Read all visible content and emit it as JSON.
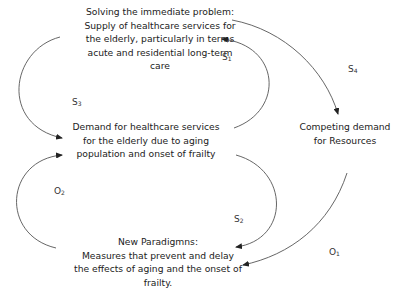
{
  "nodes": {
    "immediate": {
      "lines": [
        "Solving the immediate problem:",
        "Supply of healthcare services for",
        "the elderly, particularly in terms",
        "acute and residential long-term",
        "care"
      ]
    },
    "demand": {
      "lines": [
        "Demand for healthcare services",
        "for the elderly due to aging",
        "population and onset of frailty"
      ]
    },
    "competing": {
      "lines": [
        "Competing demand",
        "for Resources"
      ]
    },
    "paradigms": {
      "lines": [
        "New Paradigmns:",
        "Measures that prevent and delay",
        "the effects of aging and the onset of",
        "frailty."
      ]
    }
  },
  "labels": {
    "s1": {
      "base": "S",
      "sub": "1"
    },
    "s2": {
      "base": "S",
      "sub": "2"
    },
    "s3": {
      "base": "S",
      "sub": "3"
    },
    "s4": {
      "base": "S",
      "sub": "4"
    },
    "o1": {
      "base": "O",
      "sub": "1"
    },
    "o2": {
      "base": "O",
      "sub": "2"
    }
  },
  "colors": {
    "line": "#555555",
    "text": "#222222"
  }
}
